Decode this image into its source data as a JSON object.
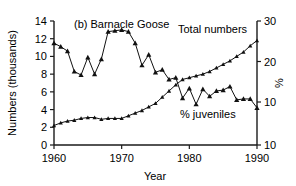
{
  "chart_data": {
    "type": "line",
    "title": "(b) Barnacle Goose",
    "xlabel": "Year",
    "ylabel": "Numbers (thousands)",
    "y2label": "%",
    "xlim": [
      1960,
      1990
    ],
    "ylim": [
      0,
      14
    ],
    "y2lim": [
      10,
      30
    ],
    "grid": false,
    "legend_position": "inline-annotations",
    "xticks": [
      1960,
      1970,
      1980,
      1990
    ],
    "xticklabels": [
      "1960",
      "1970",
      "1980",
      "1990"
    ],
    "yticks": [
      0,
      2,
      4,
      6,
      8,
      10,
      12,
      14
    ],
    "yticklabels": [
      "0",
      "2",
      "4",
      "6",
      "8",
      "10",
      "12",
      "14"
    ],
    "y2ticks": [
      10,
      20,
      30
    ],
    "y2ticklabels": [
      "10",
      "20",
      "30"
    ],
    "y2_extra_tick_label": "10",
    "annotations": [
      {
        "text": "Total numbers",
        "x": 1982,
        "y": 12.6
      },
      {
        "text": "% juveniles",
        "x": 1982.5,
        "y": 3.3
      }
    ],
    "series": [
      {
        "name": "Total numbers",
        "axis": "left",
        "marker": "triangle",
        "x": [
          1960,
          1961,
          1962,
          1963,
          1964,
          1965,
          1966,
          1967,
          1968,
          1969,
          1970,
          1971,
          1972,
          1973,
          1974,
          1975,
          1976,
          1977,
          1978,
          1979,
          1980,
          1981,
          1982,
          1983,
          1984,
          1985,
          1986,
          1987,
          1988,
          1989,
          1990
        ],
        "values": [
          2.2,
          2.5,
          2.7,
          2.8,
          3.0,
          3.1,
          3.1,
          2.9,
          3.0,
          3.0,
          3.0,
          3.3,
          3.6,
          3.9,
          4.3,
          4.7,
          5.4,
          6.1,
          6.8,
          7.4,
          7.6,
          7.8,
          8.0,
          8.3,
          8.7,
          9.1,
          9.5,
          10.0,
          10.5,
          11.2,
          11.8
        ]
      },
      {
        "name": "% juveniles",
        "axis": "right",
        "marker": "triangle",
        "x": [
          1960,
          1961,
          1962,
          1963,
          1964,
          1965,
          1966,
          1967,
          1968,
          1969,
          1970,
          1971,
          1972,
          1973,
          1974,
          1975,
          1976,
          1977,
          1978,
          1979,
          1980,
          1981,
          1982,
          1983,
          1984,
          1985,
          1986,
          1987,
          1988,
          1989,
          1990
        ],
        "values_left_scale": [
          11.5,
          11.1,
          10.6,
          8.3,
          7.9,
          9.9,
          8.0,
          9.7,
          12.8,
          12.9,
          13.0,
          12.8,
          11.5,
          9.0,
          10.2,
          8.2,
          8.5,
          7.4,
          7.6,
          5.3,
          6.4,
          4.6,
          6.3,
          5.5,
          6.1,
          6.2,
          6.6,
          5.1,
          5.2,
          5.2,
          4.2
        ]
      }
    ]
  }
}
